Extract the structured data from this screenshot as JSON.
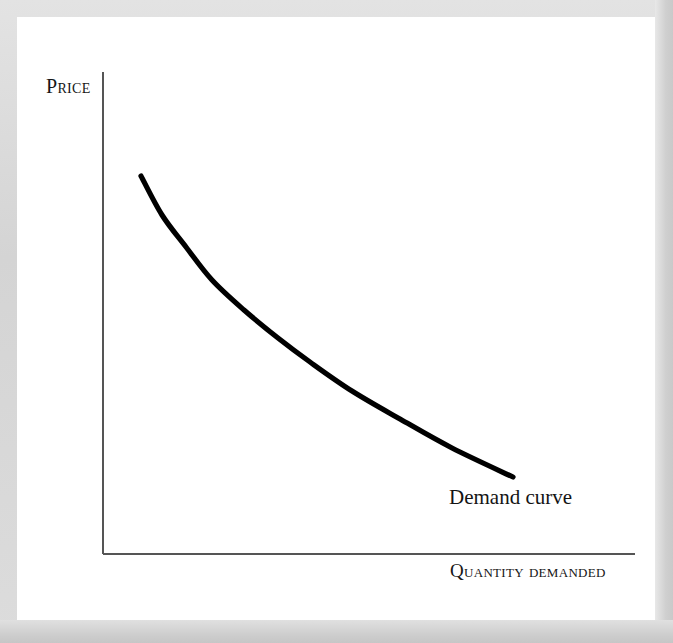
{
  "figure": {
    "kind": "economics-demand-curve-diagram",
    "background_color": "#d7d7d7",
    "panel_color": "#ffffff",
    "axis_color": "#555555",
    "curve_color": "#000000"
  },
  "labels": {
    "y_axis_title": "Price",
    "x_axis_title": "Quantity demanded",
    "curve_annotation": "Demand curve"
  },
  "chart_data": {
    "type": "line",
    "title": "",
    "subtitle": "",
    "xlabel": "Quantity demanded",
    "ylabel": "Price",
    "grid": false,
    "legend": null,
    "axis_ticks": {
      "x": [],
      "y": []
    },
    "xlim": [
      0,
      100
    ],
    "ylim": [
      0,
      100
    ],
    "annotations": [
      {
        "text": "Demand curve",
        "x": 75,
        "y": 15,
        "describes": "downward-sloping convex demand curve"
      }
    ],
    "series": [
      {
        "name": "Demand curve",
        "color": "#000000",
        "linewidth": 5,
        "shape": "convex-decreasing",
        "x": [
          7,
          12,
          18,
          25,
          32,
          40,
          48,
          57,
          66,
          75,
          77
        ],
        "y": [
          79,
          69,
          60,
          51,
          44,
          37,
          31,
          26,
          22,
          19,
          18
        ],
        "points_px": [
          {
            "x": 141,
            "y": 176
          },
          {
            "x": 162,
            "y": 215
          },
          {
            "x": 186,
            "y": 247
          },
          {
            "x": 212,
            "y": 280
          },
          {
            "x": 244,
            "y": 310
          },
          {
            "x": 278,
            "y": 338
          },
          {
            "x": 310,
            "y": 362
          },
          {
            "x": 352,
            "y": 391
          },
          {
            "x": 400,
            "y": 419
          },
          {
            "x": 452,
            "y": 448
          },
          {
            "x": 513,
            "y": 477
          }
        ]
      }
    ],
    "axes_geometry_px": {
      "origin": {
        "x": 103,
        "y": 554
      },
      "y_axis_top": {
        "x": 103,
        "y": 72
      },
      "x_axis_right": {
        "x": 635,
        "y": 554
      }
    }
  }
}
